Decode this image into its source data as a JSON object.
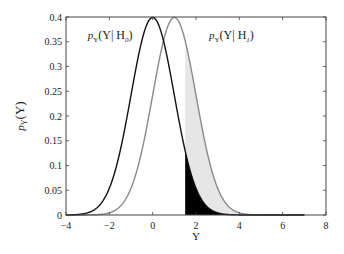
{
  "chart_data": {
    "type": "line",
    "title": "",
    "xlabel": "Υ",
    "ylabel": "pΥ(Υ)",
    "xlim": [
      -4,
      8
    ],
    "ylim": [
      0,
      0.4
    ],
    "xticks": [
      -4,
      -2,
      0,
      2,
      4,
      6,
      8
    ],
    "yticks": [
      0,
      0.05,
      0.1,
      0.15,
      0.2,
      0.25,
      0.3,
      0.35,
      0.4
    ],
    "ytick_labels": [
      "0",
      "0.05",
      "0.1",
      "0.15",
      "0.2",
      "0.25",
      "0.3",
      "0.35",
      "0.4"
    ],
    "xtick_labels": [
      "−4",
      "−2",
      "0",
      "2",
      "4",
      "6",
      "8"
    ],
    "grid": false,
    "legend": null,
    "threshold": 1.5,
    "series": [
      {
        "name": "pY(Y|H0)",
        "distribution": "gaussian",
        "mean": 0,
        "std": 1,
        "x_range": [
          -4,
          7
        ],
        "color": "#111111"
      },
      {
        "name": "pY(Y|H1)",
        "distribution": "gaussian",
        "mean": 1,
        "std": 1,
        "x_range": [
          -4,
          7
        ],
        "color": "#8a8a8a"
      }
    ],
    "shaded_regions": [
      {
        "name": "false-alarm-region",
        "description": "area under H0 for x > threshold",
        "color": "#000000"
      },
      {
        "name": "detection-region",
        "description": "area between H0 and H1 for x > threshold",
        "color": "#e6e6e6"
      }
    ],
    "annotations": [
      {
        "text_main": "p",
        "text_sub": "Υ",
        "text_rest": "(Υ| H",
        "text_rest_sub": "0",
        "text_end": ")",
        "x": -3.0,
        "y": 0.355
      },
      {
        "text_main": "p",
        "text_sub": "Υ",
        "text_rest": "(Υ| H",
        "text_rest_sub": "1",
        "text_end": ")",
        "x": 2.6,
        "y": 0.355
      }
    ]
  },
  "labels": {
    "xlabel": "Υ",
    "ylabel_main": "p",
    "ylabel_sub": "Υ",
    "ylabel_rest": "(Υ)",
    "annot0": "pΥ(Υ| H0)",
    "annot1": "pΥ(Υ| H1)"
  }
}
